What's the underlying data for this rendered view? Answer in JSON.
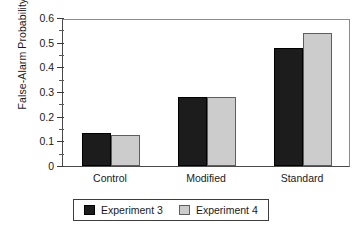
{
  "chart_data": {
    "type": "bar",
    "title": "",
    "xlabel": "",
    "ylabel": "False-Alarm Probability",
    "categories": [
      "Control",
      "Modified",
      "Standard"
    ],
    "series": [
      {
        "name": "Experiment 3",
        "color": "#1c1c1c",
        "values": [
          0.135,
          0.28,
          0.48
        ]
      },
      {
        "name": "Experiment 4",
        "color": "#cccccc",
        "values": [
          0.125,
          0.28,
          0.54
        ]
      }
    ],
    "ylim": [
      0,
      0.6
    ],
    "ytick_labels": [
      "0",
      "0.1",
      "0.2",
      "0.3",
      "0.4",
      "0.5",
      "0.6"
    ],
    "ytick_values": [
      0,
      0.1,
      0.2,
      0.3,
      0.4,
      0.5,
      0.6
    ],
    "yminor_values": [
      0.05,
      0.15,
      0.25,
      0.35,
      0.45,
      0.55
    ],
    "grid": false,
    "legend_position": "bottom-center"
  }
}
